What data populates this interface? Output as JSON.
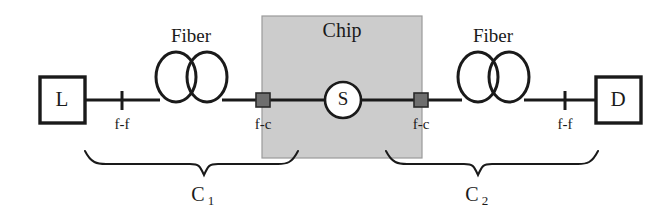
{
  "figure": {
    "type": "optical-experiment-schematic",
    "title_text": "",
    "background_color": "#ffffff",
    "line_color": "#1a1a1a",
    "chip_fill_color": "#cccccc",
    "connector_color": "#6e6e6e"
  },
  "nodes": {
    "laser_box": {
      "label": "L"
    },
    "detector_box": {
      "label": "D"
    },
    "sample_circle": {
      "label": "S"
    }
  },
  "regions": {
    "chip": {
      "label": "Chip"
    }
  },
  "fiber_spools": [
    {
      "label": "Fiber",
      "side": "left"
    },
    {
      "label": "Fiber",
      "side": "right"
    }
  ],
  "connector_labels": [
    {
      "label": "f-f",
      "side": "left",
      "kind": "fiber-to-fiber"
    },
    {
      "label": "f-c",
      "side": "left",
      "kind": "fiber-to-chip"
    },
    {
      "label": "f-c",
      "side": "right",
      "kind": "fiber-to-chip"
    },
    {
      "label": "f-f",
      "side": "right",
      "kind": "fiber-to-fiber"
    }
  ],
  "braces": [
    {
      "label": "C",
      "subscript": "1",
      "side": "left"
    },
    {
      "label": "C",
      "subscript": "2",
      "side": "right"
    }
  ]
}
